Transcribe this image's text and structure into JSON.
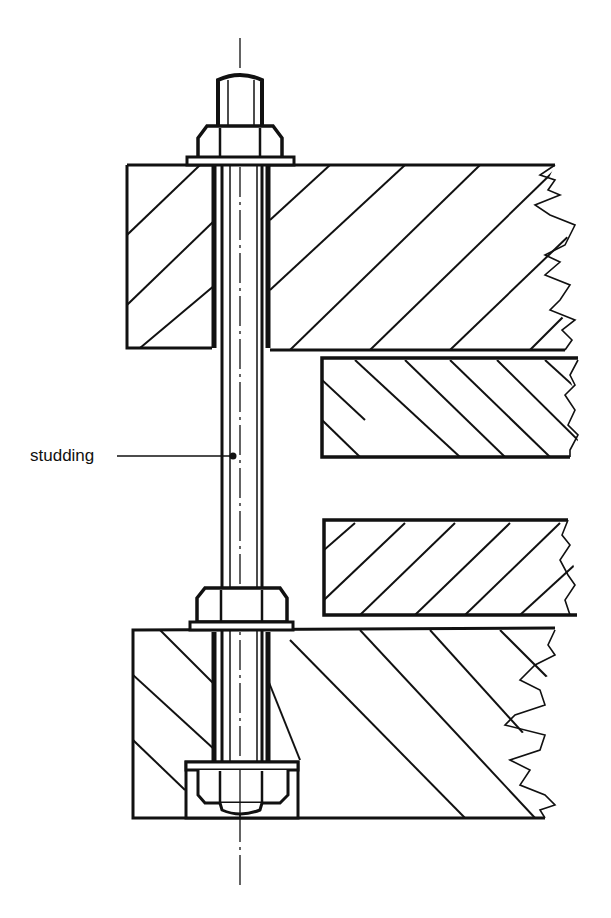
{
  "diagram": {
    "labels": [
      {
        "id": "studding",
        "text": "studding",
        "x": 30,
        "y": 452
      }
    ],
    "components": {
      "studding": "threaded rod (studding) with centre line",
      "top_nut": "hex nut with washer",
      "middle_nut": "hex nut with washer",
      "bottom_nut": "recessed hex nut with washer",
      "timbers": [
        "top-block",
        "upper-middle-block",
        "lower-middle-block",
        "bottom-block"
      ]
    },
    "colors": {
      "ink": "#111111",
      "paper": "#ffffff"
    }
  }
}
